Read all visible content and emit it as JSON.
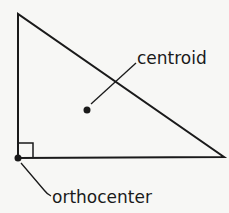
{
  "diagram": {
    "type": "right-triangle",
    "labels": {
      "centroid": "centroid",
      "orthocenter": "orthocenter"
    },
    "colors": {
      "background": "#f7f7f5",
      "stroke": "#1a1a1a"
    }
  }
}
